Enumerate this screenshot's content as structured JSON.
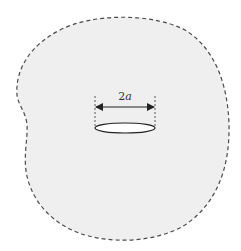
{
  "diagram": {
    "boundary": {
      "style": "dashed",
      "fill": "#efefef",
      "stroke": "#4a4a4a"
    },
    "crack": {
      "shape": "ellipse",
      "stroke": "#222222",
      "fill": "#ffffff"
    },
    "dimension": {
      "label_number": "2",
      "label_symbol": "a",
      "meaning": "crack length",
      "arrow_color": "#222222"
    }
  }
}
